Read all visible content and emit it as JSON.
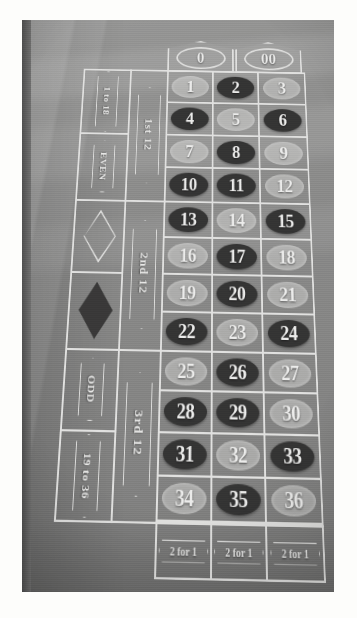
{
  "scene": {
    "subject": "american-roulette-table-layout",
    "zeros": [
      {
        "label": "0",
        "color_class": "green"
      },
      {
        "label": "00",
        "color_class": "green"
      }
    ],
    "numbers": [
      {
        "n": "1",
        "c": "red"
      },
      {
        "n": "2",
        "c": "black"
      },
      {
        "n": "3",
        "c": "red"
      },
      {
        "n": "4",
        "c": "black"
      },
      {
        "n": "5",
        "c": "red"
      },
      {
        "n": "6",
        "c": "black"
      },
      {
        "n": "7",
        "c": "red"
      },
      {
        "n": "8",
        "c": "black"
      },
      {
        "n": "9",
        "c": "red"
      },
      {
        "n": "10",
        "c": "black"
      },
      {
        "n": "11",
        "c": "black"
      },
      {
        "n": "12",
        "c": "red"
      },
      {
        "n": "13",
        "c": "black"
      },
      {
        "n": "14",
        "c": "red"
      },
      {
        "n": "15",
        "c": "black"
      },
      {
        "n": "16",
        "c": "red"
      },
      {
        "n": "17",
        "c": "black"
      },
      {
        "n": "18",
        "c": "red"
      },
      {
        "n": "19",
        "c": "red"
      },
      {
        "n": "20",
        "c": "black"
      },
      {
        "n": "21",
        "c": "red"
      },
      {
        "n": "22",
        "c": "black"
      },
      {
        "n": "23",
        "c": "red"
      },
      {
        "n": "24",
        "c": "black"
      },
      {
        "n": "25",
        "c": "red"
      },
      {
        "n": "26",
        "c": "black"
      },
      {
        "n": "27",
        "c": "red"
      },
      {
        "n": "28",
        "c": "black"
      },
      {
        "n": "29",
        "c": "black"
      },
      {
        "n": "30",
        "c": "red"
      },
      {
        "n": "31",
        "c": "black"
      },
      {
        "n": "32",
        "c": "red"
      },
      {
        "n": "33",
        "c": "black"
      },
      {
        "n": "34",
        "c": "red"
      },
      {
        "n": "35",
        "c": "black"
      },
      {
        "n": "36",
        "c": "red"
      }
    ],
    "dozens": [
      {
        "label": "1st 12"
      },
      {
        "label": "2nd 12"
      },
      {
        "label": "3rd 12"
      }
    ],
    "outside_bets": [
      {
        "label": "1 to 18",
        "kind": "text"
      },
      {
        "label": "EVEN",
        "kind": "text"
      },
      {
        "label": "RED",
        "kind": "diamond-outline"
      },
      {
        "label": "BLACK",
        "kind": "diamond-filled"
      },
      {
        "label": "ODD",
        "kind": "text"
      },
      {
        "label": "19 to 36",
        "kind": "text"
      }
    ],
    "column_bets": [
      {
        "label": "2 for 1"
      },
      {
        "label": "2 for 1"
      },
      {
        "label": "2 for 1"
      }
    ],
    "palette": {
      "felt": "#8b8b88",
      "line": "#e9e9e4",
      "black_pocket": "#302f2e",
      "red_pocket": "#d8d8d3",
      "paper_margin": "#fdfdfb"
    }
  }
}
